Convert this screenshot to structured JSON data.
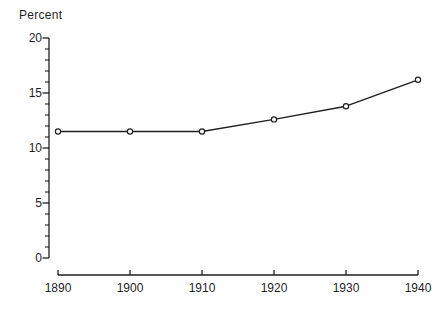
{
  "colors": {
    "ink": "#1f1f1f",
    "background": "#ffffff"
  },
  "chart_data": {
    "type": "line",
    "title": "",
    "ylabel": "Percent",
    "xlabel": "",
    "x": [
      1890,
      1900,
      1910,
      1920,
      1930,
      1940
    ],
    "values": [
      11.5,
      11.5,
      11.5,
      12.6,
      13.8,
      16.2
    ],
    "xticks": [
      "1890",
      "1900",
      "1910",
      "1920",
      "1930",
      "1940"
    ],
    "yticks": [
      "0",
      "5",
      "10",
      "15",
      "20"
    ],
    "xlim": [
      1890,
      1940
    ],
    "ylim": [
      0,
      20
    ],
    "y_minor_step": 1,
    "grid": false,
    "legend": "none",
    "marker": "open-circle",
    "line_color": "#1f1f1f",
    "marker_fill": "#ffffff"
  }
}
